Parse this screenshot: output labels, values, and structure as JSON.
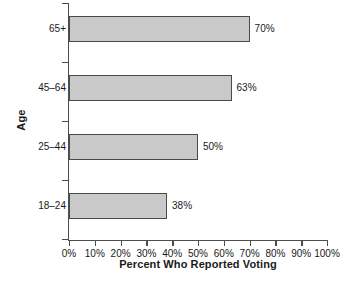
{
  "chart_data": {
    "type": "bar",
    "orientation": "horizontal",
    "title": "",
    "xlabel": "Percent Who Reported Voting",
    "ylabel": "Age",
    "categories": [
      "18–24",
      "25–44",
      "45–64",
      "65+"
    ],
    "values": [
      38,
      50,
      63,
      70
    ],
    "data_labels": [
      "38%",
      "50%",
      "63%",
      "70%"
    ],
    "xlim": [
      0,
      100
    ],
    "xticks": [
      0,
      10,
      20,
      30,
      40,
      50,
      60,
      70,
      80,
      90,
      100
    ],
    "xtick_labels": [
      "0%",
      "10%",
      "20%",
      "30%",
      "40%",
      "50%",
      "60%",
      "70%",
      "80%",
      "90%",
      "100%"
    ],
    "grid": false,
    "legend": false,
    "bar_fill_color": "#c9c9c9",
    "bar_edge_color": "#4a4a4a",
    "axis_color": "#4d4d4d",
    "text_color": "#1a1a1a",
    "background_color": "#ffffff"
  },
  "bars": [
    {
      "category": "65+",
      "value": 70,
      "label": "70%"
    },
    {
      "category": "45–64",
      "value": 63,
      "label": "63%"
    },
    {
      "category": "25–44",
      "value": 50,
      "label": "50%"
    },
    {
      "category": "18–24",
      "value": 38,
      "label": "38%"
    }
  ],
  "xticks": [
    {
      "label": "0%",
      "value": 0
    },
    {
      "label": "10%",
      "value": 10
    },
    {
      "label": "20%",
      "value": 20
    },
    {
      "label": "30%",
      "value": 30
    },
    {
      "label": "40%",
      "value": 40
    },
    {
      "label": "50%",
      "value": 50
    },
    {
      "label": "60%",
      "value": 60
    },
    {
      "label": "70%",
      "value": 70
    },
    {
      "label": "80%",
      "value": 80
    },
    {
      "label": "90%",
      "value": 90
    },
    {
      "label": "100%",
      "value": 100
    }
  ],
  "axes": {
    "x_title": "Percent Who Reported Voting",
    "y_title": "Age"
  }
}
